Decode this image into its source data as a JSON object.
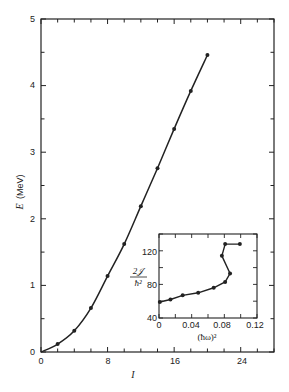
{
  "chart_data": [
    {
      "type": "line",
      "title": "",
      "xlabel": "I",
      "ylabel": "E (MeV)",
      "xlim": [
        0,
        28
      ],
      "ylim": [
        0,
        5
      ],
      "xticks": [
        0,
        8,
        16,
        24
      ],
      "yticks": [
        0,
        1,
        2,
        3,
        4,
        5
      ],
      "grid": false,
      "x": [
        0,
        2,
        4,
        6,
        8,
        10,
        12,
        14,
        16,
        18,
        20
      ],
      "values": [
        0,
        0.12,
        0.32,
        0.66,
        1.14,
        1.62,
        2.19,
        2.76,
        3.35,
        3.92,
        4.46
      ],
      "marker_from_index": 1
    },
    {
      "type": "line",
      "title": "inset",
      "xlabel": "(ħω)²",
      "ylabel": "2𝒥/ħ²",
      "xlim": [
        0,
        0.12
      ],
      "ylim": [
        40,
        140
      ],
      "xticks": [
        0,
        0.04,
        0.08,
        0.12
      ],
      "yticks": [
        40,
        80,
        120
      ],
      "grid": false,
      "x": [
        0.001,
        0.014,
        0.029,
        0.048,
        0.067,
        0.081,
        0.087,
        0.077,
        0.081,
        0.099
      ],
      "values": [
        59,
        62,
        67,
        70,
        76,
        83,
        93,
        114,
        128,
        128
      ]
    }
  ],
  "main": {
    "ylabel_main": "E",
    "ylabel_unit": "(MeV)",
    "xlabel": "I",
    "xtick_labels": [
      "0",
      "8",
      "16",
      "24"
    ],
    "ytick_labels": [
      "0",
      "1",
      "2",
      "3",
      "4",
      "5"
    ]
  },
  "inset": {
    "ylabel_num": "2𝒥",
    "ylabel_den": "ħ²",
    "xlabel": "(ħω)²",
    "xtick_labels": [
      "0",
      "0.04",
      "0.08",
      "0.12"
    ],
    "ytick_labels": [
      "40",
      "80",
      "120"
    ]
  }
}
